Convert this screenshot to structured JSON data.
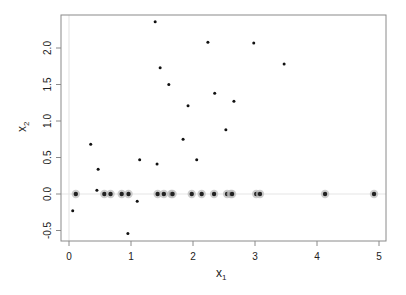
{
  "chart_data": {
    "type": "scatter",
    "title": "",
    "xlabel": "x1",
    "ylabel": "x2",
    "xlabel_main": "x",
    "xlabel_sub": "1",
    "ylabel_main": "x",
    "ylabel_sub": "2",
    "xlim": [
      -0.12,
      5.05
    ],
    "ylim": [
      -0.64,
      2.46
    ],
    "x_ticks": [
      0,
      1,
      2,
      3,
      4,
      5
    ],
    "x_tick_labels": [
      "0",
      "1",
      "2",
      "3",
      "4",
      "5"
    ],
    "y_ticks": [
      -0.5,
      0.0,
      0.5,
      1.0,
      1.5,
      2.0
    ],
    "y_tick_labels": [
      "-0.5",
      "0.0",
      "0.5",
      "1.0",
      "1.5",
      "2.0"
    ],
    "grid": false,
    "reference_lines": {
      "horizontal_y": 0,
      "vertical_x": 0,
      "color": "#e6e6e6"
    },
    "legend": null,
    "series": [
      {
        "name": "points",
        "marker": "small-dot",
        "color": "#111111",
        "points": [
          [
            0.06,
            -0.23
          ],
          [
            0.35,
            0.68
          ],
          [
            0.45,
            0.05
          ],
          [
            0.47,
            0.34
          ],
          [
            0.95,
            -0.54
          ],
          [
            1.1,
            -0.1
          ],
          [
            1.14,
            0.47
          ],
          [
            1.39,
            2.36
          ],
          [
            1.42,
            0.41
          ],
          [
            1.47,
            1.73
          ],
          [
            1.61,
            1.5
          ],
          [
            1.84,
            0.75
          ],
          [
            1.92,
            1.21
          ],
          [
            2.06,
            0.47
          ],
          [
            2.24,
            2.08
          ],
          [
            2.35,
            1.38
          ],
          [
            2.53,
            0.88
          ],
          [
            2.66,
            1.27
          ],
          [
            2.98,
            2.07
          ],
          [
            3.47,
            1.78
          ]
        ]
      },
      {
        "name": "zero-line points",
        "marker": "dot-with-halo",
        "color": "#222222",
        "halo_color": "#bdbdbd",
        "points": [
          [
            0.11,
            0
          ],
          [
            0.57,
            0
          ],
          [
            0.67,
            0
          ],
          [
            0.85,
            0
          ],
          [
            0.96,
            0
          ],
          [
            1.43,
            0
          ],
          [
            1.53,
            0
          ],
          [
            1.65,
            0
          ],
          [
            1.67,
            0
          ],
          [
            1.98,
            0
          ],
          [
            2.14,
            0
          ],
          [
            2.34,
            0
          ],
          [
            2.55,
            0
          ],
          [
            2.61,
            0
          ],
          [
            2.63,
            0
          ],
          [
            3.02,
            0
          ],
          [
            3.08,
            0
          ],
          [
            4.13,
            0
          ],
          [
            4.92,
            0
          ]
        ]
      }
    ]
  }
}
